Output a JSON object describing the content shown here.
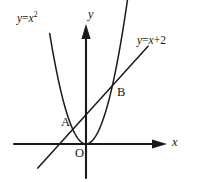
{
  "figure": {
    "background_color": "#ffffff",
    "ink_color": "#1a1a1a"
  },
  "labels": {
    "parabola_equation": {
      "lhs": "y",
      "operator": "=",
      "variable": "x",
      "exponent": "2"
    },
    "line_equation": {
      "lhs": "y",
      "operator": "=",
      "variable": "x",
      "plus": "+",
      "constant": "2"
    },
    "y_axis": "y",
    "x_axis": "x",
    "origin": "O",
    "point_a": "A",
    "point_b": "B"
  },
  "chart_data": {
    "type": "line",
    "title": "",
    "xlabel": "x",
    "ylabel": "y",
    "grid": false,
    "legend_position": "inline-annotations",
    "axes": {
      "origin_px": [
        86,
        144
      ],
      "unit_px_x": 13.2,
      "unit_px_y": 14.6,
      "x_axis_px": {
        "x_start": 14,
        "x_end": 160,
        "y": 144,
        "arrow": "right"
      },
      "y_axis_px": {
        "y_start": 27,
        "y_end": 178,
        "x": 86,
        "arrow": "up"
      },
      "xlim": [
        -5.5,
        5.6
      ],
      "ylim": [
        -2.3,
        8.0
      ],
      "ticks": []
    },
    "series": [
      {
        "name": "y = x^2",
        "type": "parabola",
        "label": "y = x²",
        "label_px": [
          17,
          13
        ],
        "equation": "y = x^2",
        "coefficients": {
          "a": 1,
          "b": 0,
          "c": 0
        },
        "vertex": [
          0,
          0
        ],
        "x_domain": [
          -2.75,
          3.2
        ],
        "points": [
          [
            -2.75,
            7.56
          ],
          [
            -2.0,
            4.0
          ],
          [
            -1.0,
            1.0
          ],
          [
            0.0,
            0.0
          ],
          [
            1.0,
            1.0
          ],
          [
            2.0,
            4.0
          ],
          [
            3.2,
            8.0
          ]
        ]
      },
      {
        "name": "y = x + 2",
        "type": "straight-line",
        "label": "y = x + 2",
        "label_px": [
          137,
          35
        ],
        "equation": "y = x + 2",
        "slope": 1,
        "intercept": 2,
        "x_domain": [
          -3.65,
          4.7
        ],
        "points": [
          [
            -3.65,
            -1.65
          ],
          [
            -1.0,
            1.0
          ],
          [
            0.0,
            2.0
          ],
          [
            2.0,
            4.0
          ],
          [
            4.7,
            6.7
          ]
        ]
      }
    ],
    "annotations": [
      {
        "label": "A",
        "kind": "intersection",
        "x": -1,
        "y": 1,
        "point_px": [
          72,
          130
        ],
        "label_px": [
          61,
          116
        ]
      },
      {
        "label": "B",
        "kind": "intersection",
        "x": 2,
        "y": 4,
        "point_px": [
          112,
          85
        ],
        "label_px": [
          117,
          86
        ]
      },
      {
        "label": "O",
        "kind": "origin",
        "x": 0,
        "y": 0,
        "point_px": [
          86,
          144
        ],
        "label_px": [
          75,
          147
        ]
      }
    ]
  }
}
